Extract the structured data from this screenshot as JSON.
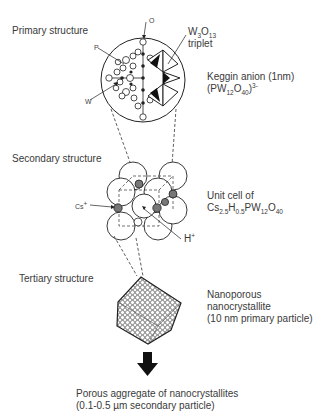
{
  "levels": {
    "primary": {
      "title": "Primary structure",
      "triplet_formula": {
        "w": "W",
        "w_sub": "3",
        "o": "O",
        "o_sub": "13"
      },
      "triplet_label": "triplet",
      "anion_label": "Keggin anion (1nm)",
      "anion_formula": {
        "open": "(PW",
        "w_sub": "12",
        "o": "O",
        "o_sub": "40",
        "close": ")",
        "charge": "3-"
      },
      "atom_labels": {
        "o": "O",
        "p": "P",
        "w": "W"
      }
    },
    "secondary": {
      "title": "Secondary structure",
      "cell_label": "Unit cell of",
      "cell_formula": {
        "cs": "Cs",
        "cs_sub": "2.5",
        "h": "H",
        "h_sub": "0.5",
        "pw": "PW",
        "pw_sub": "12",
        "o": "O",
        "o_sub": "40"
      },
      "cs_label": "Cs",
      "cs_charge": "+",
      "h_label": "H",
      "h_charge": "+"
    },
    "tertiary": {
      "title": "Tertiary structure",
      "line1": "Nanoporous",
      "line2": "nanocrystallite",
      "line3": "(10 nm primary particle)"
    },
    "aggregate": {
      "line1": "Porous aggregate of nanocrystallites",
      "line2": "(0.1-0.5 µm secondary particle)"
    }
  },
  "arrow_icon": "down-arrow-icon",
  "colors": {
    "line": "#222222",
    "text": "#3a3a3a",
    "sphere": "#ffffff"
  }
}
